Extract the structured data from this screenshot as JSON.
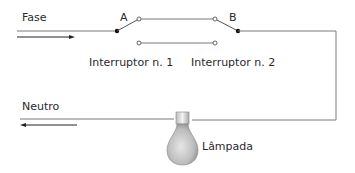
{
  "diagram": {
    "type": "three-way switch circuit",
    "labels": {
      "phase": "Fase",
      "neutral": "Neutro",
      "switch_a_terminal": "A",
      "switch_b_terminal": "B",
      "switch_1": "Interruptor n. 1",
      "switch_2": "Interruptor n. 2",
      "lamp": "Lâmpada"
    },
    "colors": {
      "wire": "#7a7a7a",
      "arrow": "#222222",
      "dot": "#111111",
      "text": "#2a2a2a",
      "lamp_glass": "#bdbdbd",
      "lamp_base": "#e0e0e0"
    },
    "nodes": [
      {
        "id": "A",
        "role": "common terminal switch 1"
      },
      {
        "id": "B",
        "role": "common terminal switch 2"
      }
    ],
    "edges": [
      {
        "from": "Fase",
        "to": "A"
      },
      {
        "from": "A",
        "to": "traveler-upper"
      },
      {
        "from": "traveler-upper",
        "to": "B"
      },
      {
        "from": "traveler-lower",
        "to": "open"
      },
      {
        "from": "B",
        "to": "Lâmpada"
      },
      {
        "from": "Lâmpada",
        "to": "Neutro"
      }
    ]
  }
}
